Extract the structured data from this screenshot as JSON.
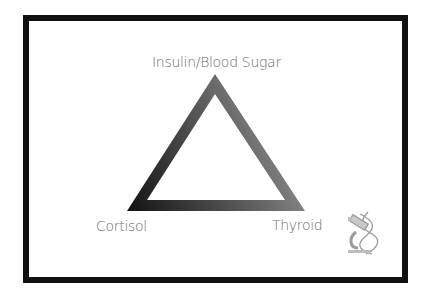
{
  "diagram": {
    "type": "triangle",
    "vertices": {
      "top": "Insulin/Blood Sugar",
      "bottom_left": "Cortisol",
      "bottom_right": "Thyroid"
    },
    "colors": {
      "frame": "#111111",
      "triangle_dark": "#1a1a1a",
      "triangle_light": "#8a8a8a",
      "label": "#6b6b6b"
    },
    "icon": "microscope-dna-icon"
  }
}
